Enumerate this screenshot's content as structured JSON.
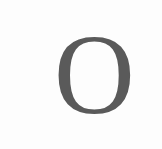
{
  "glyph": {
    "character": "O",
    "color": "#5a5a5a"
  },
  "background": "#fdfdfd"
}
